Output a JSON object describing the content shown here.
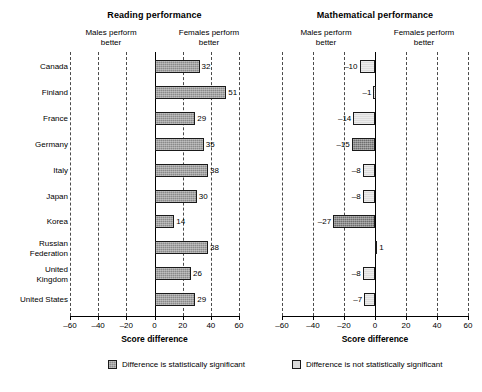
{
  "figure": {
    "legend": [
      {
        "key": "significant",
        "label": "Difference is statistically significant",
        "swatch": "sig",
        "color": "#8a8a8a"
      },
      {
        "key": "not_significant",
        "label": "Difference is not statistically significant",
        "swatch": "nonsig",
        "color": "#dcdcdc"
      }
    ]
  },
  "chart_data": [
    {
      "type": "bar",
      "orientation": "horizontal",
      "title": "Reading performance",
      "xlabel": "Score difference",
      "ylabel": "",
      "xlim": [
        -60,
        60
      ],
      "xticks": [
        -60,
        -40,
        -20,
        0,
        20,
        40,
        60
      ],
      "xticklabels": [
        "–60",
        "–40",
        "–20",
        "0",
        "20",
        "40",
        "60"
      ],
      "grid": "vertical-dashed",
      "annotations": {
        "left": "Males perform\nbetter",
        "right": "Females perform\nbetter",
        "left_line1": "Males perform",
        "left_line2": "better",
        "right_line1": "Females perform",
        "right_line2": "better"
      },
      "categories": [
        "Canada",
        "Finland",
        "France",
        "Germany",
        "Italy",
        "Japan",
        "Korea",
        "Russian Federation",
        "United Kingdom",
        "United States"
      ],
      "values": [
        32,
        51,
        29,
        35,
        38,
        30,
        14,
        38,
        26,
        29
      ],
      "labels": [
        "32",
        "51",
        "29",
        "35",
        "38",
        "30",
        "14",
        "38",
        "26",
        "29"
      ],
      "significance": [
        true,
        true,
        true,
        true,
        true,
        true,
        true,
        true,
        true,
        true
      ]
    },
    {
      "type": "bar",
      "orientation": "horizontal",
      "title": "Mathematical performance",
      "xlabel": "Score difference",
      "ylabel": "",
      "xlim": [
        -60,
        60
      ],
      "xticks": [
        -60,
        -40,
        -20,
        0,
        20,
        40,
        60
      ],
      "xticklabels": [
        "–60",
        "–40",
        "–20",
        "0",
        "20",
        "40",
        "60"
      ],
      "grid": "vertical-dashed",
      "annotations": {
        "left": "Males perform\nbetter",
        "right": "Females perform\nbetter",
        "left_line1": "Males perform",
        "left_line2": "better",
        "right_line1": "Females perform",
        "right_line2": "better"
      },
      "categories": [
        "Canada",
        "Finland",
        "France",
        "Germany",
        "Italy",
        "Japan",
        "Korea",
        "Russian Federation",
        "United Kingdom",
        "United States"
      ],
      "values": [
        -10,
        -1,
        -14,
        -15,
        -8,
        -8,
        -27,
        1,
        -8,
        -7
      ],
      "labels": [
        "–10",
        "–1",
        "–14",
        "–15",
        "–8",
        "–8",
        "–27",
        "1",
        "–8",
        "–7"
      ],
      "significance": [
        false,
        false,
        false,
        true,
        false,
        false,
        true,
        false,
        false,
        false
      ]
    }
  ],
  "row_labels": [
    {
      "line1": "Canada",
      "line2": ""
    },
    {
      "line1": "Finland",
      "line2": ""
    },
    {
      "line1": "France",
      "line2": ""
    },
    {
      "line1": "Germany",
      "line2": ""
    },
    {
      "line1": "Italy",
      "line2": ""
    },
    {
      "line1": "Japan",
      "line2": ""
    },
    {
      "line1": "Korea",
      "line2": ""
    },
    {
      "line1": "Russian",
      "line2": "Federation"
    },
    {
      "line1": "United",
      "line2": "Kingdom"
    },
    {
      "line1": "United States",
      "line2": ""
    }
  ]
}
